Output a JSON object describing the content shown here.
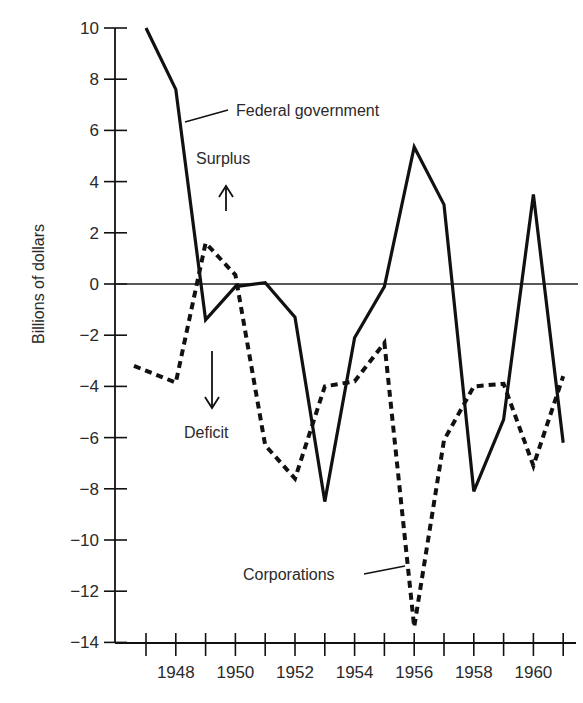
{
  "chart_data": {
    "type": "line",
    "title": "",
    "xlabel": "",
    "ylabel": "Billions of dollars",
    "ylim": [
      -14,
      10
    ],
    "xlim": [
      1947,
      1961
    ],
    "grid": false,
    "legend_position": "inline labels",
    "x": [
      1947,
      1948,
      1949,
      1950,
      1951,
      1952,
      1953,
      1954,
      1955,
      1956,
      1957,
      1958,
      1959,
      1960,
      1961
    ],
    "x_tick_labels": [
      "1948",
      "1950",
      "1952",
      "1954",
      "1956",
      "1958",
      "1960"
    ],
    "y_tick_labels": [
      "10",
      "8",
      "6",
      "4",
      "2",
      "0",
      "−2",
      "−4",
      "−6",
      "−8",
      "−10",
      "−12",
      "−14"
    ],
    "series": [
      {
        "name": "Federal government",
        "style": "solid",
        "values": [
          10.0,
          7.6,
          -1.4,
          -0.1,
          0.05,
          -1.3,
          -8.5,
          -2.1,
          -0.1,
          5.35,
          3.1,
          -8.1,
          -5.3,
          3.5,
          -6.2
        ]
      },
      {
        "name": "Corporations",
        "style": "dashed",
        "values": [
          -3.2,
          -3.85,
          1.6,
          0.35,
          -6.3,
          -7.6,
          -4.0,
          -3.8,
          -2.3,
          -13.4,
          -6.1,
          -4.0,
          -3.9,
          -7.1,
          -3.6
        ]
      }
    ],
    "annotations": [
      {
        "text": "Federal government",
        "target_series": "Federal government"
      },
      {
        "text": "Surplus",
        "arrow": "up"
      },
      {
        "text": "Deficit",
        "arrow": "down"
      },
      {
        "text": "Corporations",
        "target_series": "Corporations"
      }
    ]
  },
  "labels": {
    "ylabel": "Billions of dollars",
    "federal": "Federal government",
    "corporations": "Corporations",
    "surplus": "Surplus",
    "deficit": "Deficit"
  },
  "colors": {
    "ink": "#111111",
    "text": "#2a2a2a",
    "background": "#ffffff"
  }
}
